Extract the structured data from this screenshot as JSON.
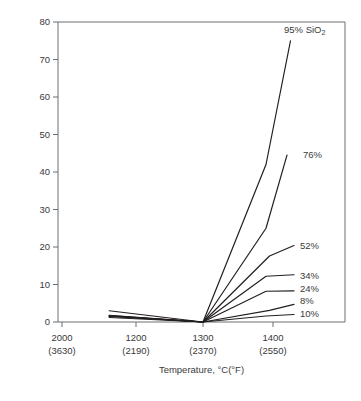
{
  "chart_data": {
    "type": "line",
    "title": "",
    "xlabel": "Temperature, °C(°F)",
    "ylabel": "Weight loss, %",
    "ylim": [
      0,
      80
    ],
    "yticks": [
      0,
      10,
      20,
      30,
      40,
      50,
      60,
      70,
      80
    ],
    "ytick_labels": [
      "0",
      "10",
      "20",
      "30",
      "40",
      "50",
      "60",
      "70",
      "80"
    ],
    "grid": false,
    "legend_position": "right-inline-labels",
    "xtick_labels_c": [
      "2000",
      "1200",
      "1300",
      "1400"
    ],
    "xtick_labels_f": [
      "(3630)",
      "(2190)",
      "(2370)",
      "(2550)"
    ],
    "x_positions_px": [
      62,
      136,
      203,
      273
    ],
    "series": [
      {
        "name": "95% SiO2",
        "label": "95% SiO",
        "label_sub": "2",
        "x": [
          1160,
          1300,
          1390,
          1425
        ],
        "y": [
          1.8,
          0.0,
          42.0,
          75.0
        ]
      },
      {
        "name": "76%",
        "label": "76%",
        "label_sub": "",
        "x": [
          1160,
          1300,
          1390,
          1420
        ],
        "y": [
          1.7,
          0.0,
          25.0,
          44.5
        ]
      },
      {
        "name": "52%",
        "label": "52%",
        "label_sub": "",
        "x": [
          1160,
          1300,
          1395,
          1430
        ],
        "y": [
          1.6,
          0.0,
          17.6,
          20.4
        ]
      },
      {
        "name": "34%",
        "label": "34%",
        "label_sub": "",
        "x": [
          1160,
          1300,
          1390,
          1430
        ],
        "y": [
          1.6,
          0.0,
          12.2,
          12.6
        ]
      },
      {
        "name": "24%",
        "label": "24%",
        "label_sub": "",
        "x": [
          1160,
          1300,
          1390,
          1430
        ],
        "y": [
          3.0,
          0.0,
          8.2,
          8.3
        ]
      },
      {
        "name": "8%",
        "label": "8%",
        "label_sub": "",
        "x": [
          1160,
          1300,
          1395,
          1430
        ],
        "y": [
          1.5,
          0.0,
          3.1,
          4.7
        ]
      },
      {
        "name": "10%",
        "label": "10%",
        "label_sub": "",
        "x": [
          1160,
          1300,
          1390,
          1430
        ],
        "y": [
          1.2,
          0.0,
          1.6,
          2.0
        ]
      }
    ],
    "series_label_positions_px": [
      {
        "x": 284,
        "y": 25
      },
      {
        "x": 303,
        "y": 150
      },
      {
        "x": 300,
        "y": 241
      },
      {
        "x": 300,
        "y": 271
      },
      {
        "x": 300,
        "y": 284
      },
      {
        "x": 300,
        "y": 296
      },
      {
        "x": 300,
        "y": 309
      }
    ]
  }
}
